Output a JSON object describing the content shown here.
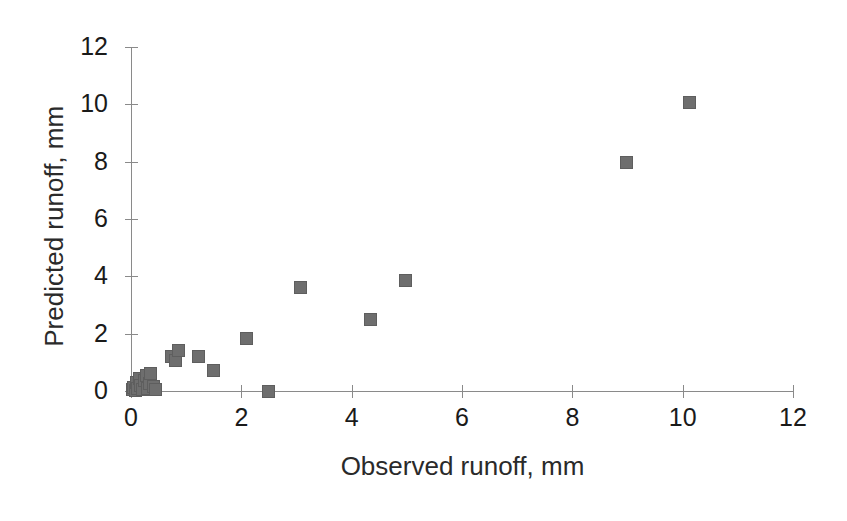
{
  "chart_data": {
    "type": "scatter",
    "title": "",
    "xlabel": "Observed runoff, mm",
    "ylabel": "Predicted runoff, mm",
    "xlim": [
      0,
      12
    ],
    "ylim": [
      0,
      12
    ],
    "xticks": [
      0,
      2,
      4,
      6,
      8,
      10,
      12
    ],
    "yticks": [
      0,
      2,
      4,
      6,
      8,
      10,
      12
    ],
    "xtick_labels": [
      "0",
      "2",
      "4",
      "6",
      "8",
      "10",
      "12"
    ],
    "ytick_labels": [
      "0",
      "2",
      "4",
      "6",
      "8",
      "10",
      "12"
    ],
    "grid": false,
    "legend": null,
    "marker": {
      "shape": "square",
      "color": "#6e6e6e",
      "edge_color": "#5e5e5e",
      "size_px": 13
    },
    "series": [
      {
        "name": "Observed vs predicted runoff",
        "points": [
          [
            0.02,
            0.05
          ],
          [
            0.05,
            0.12
          ],
          [
            0.08,
            0.02
          ],
          [
            0.1,
            0.3
          ],
          [
            0.12,
            0.08
          ],
          [
            0.15,
            0.45
          ],
          [
            0.18,
            0.2
          ],
          [
            0.2,
            0.05
          ],
          [
            0.24,
            0.35
          ],
          [
            0.28,
            0.55
          ],
          [
            0.3,
            0.1
          ],
          [
            0.33,
            0.25
          ],
          [
            0.36,
            0.6
          ],
          [
            0.4,
            0.15
          ],
          [
            0.44,
            0.05
          ],
          [
            0.73,
            1.19
          ],
          [
            0.8,
            1.05
          ],
          [
            0.87,
            1.42
          ],
          [
            1.23,
            1.22
          ],
          [
            1.5,
            0.7
          ],
          [
            2.09,
            1.82
          ],
          [
            2.5,
            0.0
          ],
          [
            3.07,
            3.62
          ],
          [
            4.35,
            2.48
          ],
          [
            4.97,
            3.85
          ],
          [
            8.98,
            7.97
          ],
          [
            10.12,
            10.05
          ]
        ]
      }
    ]
  },
  "axes": {
    "x_title": "Observed runoff, mm",
    "y_title": "Predicted runoff, mm"
  }
}
